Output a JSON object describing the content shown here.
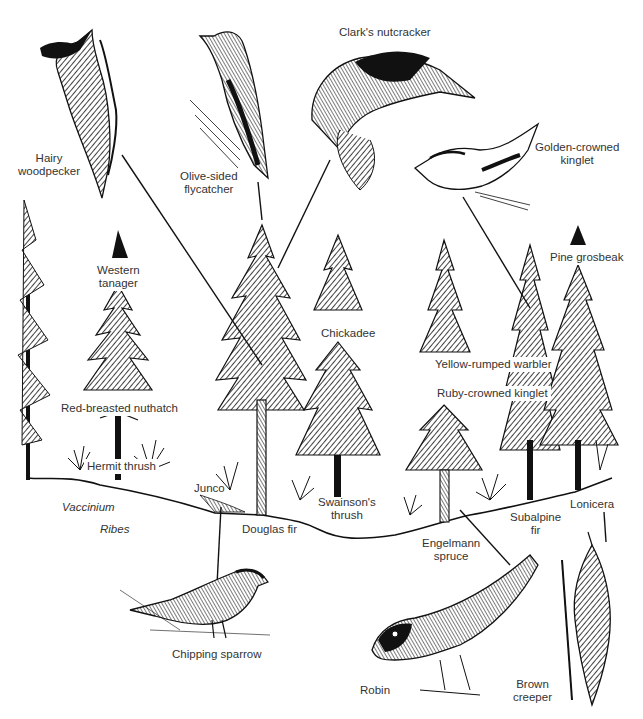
{
  "figure": {
    "background": "#ffffff",
    "ink_color": "#111111",
    "label_color": "#333333"
  },
  "birds": [
    {
      "id": "hairy-woodpecker",
      "label": "Hairy woodpecker",
      "lines": [
        "Hairy",
        "woodpecker"
      ]
    },
    {
      "id": "olive-sided-flycatcher",
      "label": "Olive-sided flycatcher",
      "lines": [
        "Olive-sided",
        "flycatcher"
      ]
    },
    {
      "id": "clarks-nutcracker",
      "label": "Clark's nutcracker",
      "lines": [
        "Clark's nutcracker"
      ]
    },
    {
      "id": "golden-crowned-kinglet",
      "label": "Golden-crowned kinglet",
      "lines": [
        "Golden-crowned",
        "kinglet"
      ]
    },
    {
      "id": "western-tanager",
      "label": "Western tanager",
      "lines": [
        "Western",
        "tanager"
      ]
    },
    {
      "id": "pine-grosbeak",
      "label": "Pine grosbeak",
      "lines": [
        "Pine grosbeak"
      ]
    },
    {
      "id": "chickadee",
      "label": "Chickadee",
      "lines": [
        "Chickadee"
      ]
    },
    {
      "id": "yellow-rumped-warbler",
      "label": "Yellow-rumped warbler",
      "lines": [
        "Yellow-rumped warbler"
      ]
    },
    {
      "id": "ruby-crowned-kinglet",
      "label": "Ruby-crowned kinglet",
      "lines": [
        "Ruby-crowned kinglet"
      ]
    },
    {
      "id": "red-breasted-nuthatch",
      "label": "Red-breasted nuthatch",
      "lines": [
        "Red-breasted nuthatch"
      ]
    },
    {
      "id": "hermit-thrush",
      "label": "Hermit thrush",
      "lines": [
        "Hermit thrush"
      ]
    },
    {
      "id": "junco",
      "label": "Junco",
      "lines": [
        "Junco"
      ]
    },
    {
      "id": "swainsons-thrush",
      "label": "Swainson's thrush",
      "lines": [
        "Swainson's",
        "thrush"
      ]
    },
    {
      "id": "chipping-sparrow",
      "label": "Chipping sparrow",
      "lines": [
        "Chipping sparrow"
      ]
    },
    {
      "id": "robin",
      "label": "Robin",
      "lines": [
        "Robin"
      ]
    },
    {
      "id": "brown-creeper",
      "label": "Brown creeper",
      "lines": [
        "Brown",
        "creeper"
      ]
    }
  ],
  "plants": [
    {
      "id": "vaccinium",
      "label": "Vaccinium",
      "italic": true
    },
    {
      "id": "ribes",
      "label": "Ribes",
      "italic": true
    },
    {
      "id": "douglas-fir",
      "label": "Douglas fir",
      "lines": [
        "Douglas fir"
      ]
    },
    {
      "id": "engelmann-spruce",
      "label": "Engelmann spruce",
      "lines": [
        "Engelmann",
        "spruce"
      ]
    },
    {
      "id": "subalpine-fir",
      "label": "Subalpine fir",
      "lines": [
        "Subalpine",
        "fir"
      ]
    },
    {
      "id": "lonicera",
      "label": "Lonicera",
      "lines": [
        "Lonicera"
      ]
    }
  ]
}
